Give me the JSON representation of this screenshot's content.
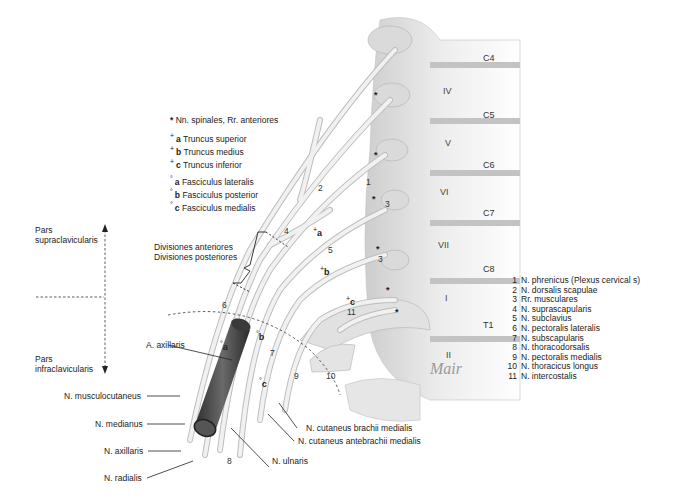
{
  "figure": {
    "type": "anatomical-illustration",
    "signature": "Mair"
  },
  "key": {
    "star": {
      "symbol": "*",
      "text": "Nn. spinales, Rr. anteriores"
    },
    "trunci": [
      {
        "symbol": "+",
        "letter": "a",
        "text": "Truncus superior"
      },
      {
        "symbol": "+",
        "letter": "b",
        "text": "Truncus medius"
      },
      {
        "symbol": "+",
        "letter": "c",
        "text": "Truncus inferior"
      }
    ],
    "fasciculi": [
      {
        "symbol": "°",
        "letter": "a",
        "text": "Fasciculus lateralis"
      },
      {
        "symbol": "°",
        "letter": "b",
        "text": "Fasciculus posterior"
      },
      {
        "symbol": "°",
        "letter": "c",
        "text": "Fasciculus medialis"
      }
    ]
  },
  "regions": {
    "supra": "Pars\nsupraclavicularis",
    "supra_l1": "Pars",
    "supra_l2": "supraclavicularis",
    "infra_l1": "Pars",
    "infra_l2": "infraclavicularis"
  },
  "divisions": {
    "anterior": "Divisiones anteriores",
    "posterior": "Divisiones posteriores"
  },
  "spinal_levels": [
    "C4",
    "C5",
    "C6",
    "C7",
    "C8",
    "T1"
  ],
  "vertebrae": [
    "IV",
    "V",
    "VI",
    "VII",
    "I",
    "II"
  ],
  "numbered_legend": [
    {
      "n": "1",
      "text": "N. phrenicus (Plexus cervical s)"
    },
    {
      "n": "2",
      "text": "N. dorsalis scapulae"
    },
    {
      "n": "3",
      "text": "Rr. musculares"
    },
    {
      "n": "4",
      "text": "N. suprascapularis"
    },
    {
      "n": "5",
      "text": "N. subclavius"
    },
    {
      "n": "6",
      "text": "N. pectoralis lateralis"
    },
    {
      "n": "7",
      "text": "N. subscapularis"
    },
    {
      "n": "8",
      "text": "N. thoracodorsalis"
    },
    {
      "n": "9",
      "text": "N. pectoralis medialis"
    },
    {
      "n": "10",
      "text": "N. thoracicus longus"
    },
    {
      "n": "11",
      "text": "N. intercostalis"
    }
  ],
  "labels": {
    "a_axillaris": "A. axillaris",
    "musculocutaneus": "N. musculocutaneus",
    "medianus": "N. medianus",
    "axillaris": "N. axillaris",
    "radialis": "N. radialis",
    "ulnaris": "N. ulnaris",
    "cut_brachii": "N. cutaneus brachii medialis",
    "cut_antebrachii": "N. cutaneus antebrachii medialis"
  },
  "markers": {
    "trunk_a": "a",
    "trunk_b": "b",
    "trunk_c": "c",
    "fasc_a": "a",
    "fasc_b": "b",
    "fasc_c": "c",
    "plus": "+",
    "deg": "°",
    "star": "*"
  },
  "colors": {
    "artery": "#4a4a4a",
    "nerve": "#e6e6e6",
    "bone": "#d9d9d9",
    "text": "#222222"
  }
}
